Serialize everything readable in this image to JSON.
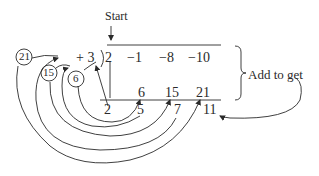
{
  "start_label": "Start",
  "add_label": "Add to get",
  "divisor": "+ 3",
  "divisor_bracket": ")",
  "coefficients": [
    "2",
    "−1",
    "−8",
    "−10"
  ],
  "products": [
    "6",
    "15",
    "21"
  ],
  "results": [
    "2",
    "5",
    "7",
    "11"
  ],
  "circled_products": [
    "21",
    "15",
    "6"
  ],
  "colors": {
    "ink": "#2a2a2a",
    "background": "#ffffff"
  }
}
